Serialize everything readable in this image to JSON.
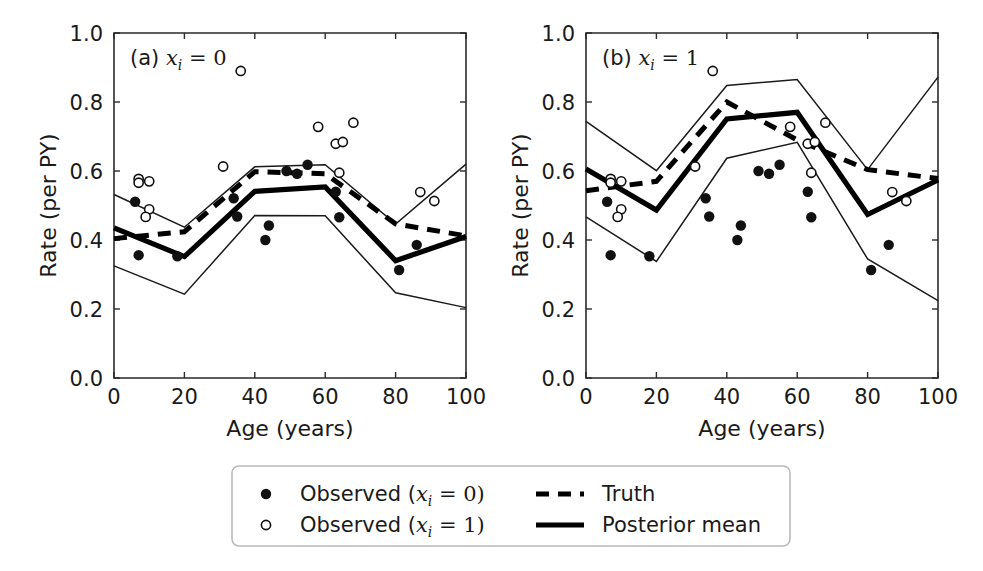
{
  "figure": {
    "width": 983,
    "height": 571,
    "background": "#ffffff",
    "ink_color": "#1a1a1a"
  },
  "chart_data": {
    "type": "line",
    "title": "",
    "panels": [
      {
        "id": "panel-a",
        "label_prefix": "(a)",
        "label_var": "x",
        "label_sub": "i",
        "label_eq": "= 0",
        "label_full": "(a) x_i = 0",
        "xlabel": "Age (years)",
        "ylabel": "Rate (per PY)",
        "xlim": [
          0,
          100
        ],
        "ylim": [
          0.0,
          1.0
        ],
        "xticks": [
          0,
          20,
          40,
          60,
          80,
          100
        ],
        "xticklabels": [
          "0",
          "20",
          "40",
          "60",
          "80",
          "100"
        ],
        "yticks": [
          0.0,
          0.2,
          0.4,
          0.6,
          0.8,
          1.0
        ],
        "yticklabels": [
          "0.0",
          "0.2",
          "0.4",
          "0.6",
          "0.8",
          "1.0"
        ],
        "grid": false,
        "series": [
          {
            "name": "Posterior mean",
            "style": "solid-thick",
            "x": [
              0,
              20,
              40,
              60,
              80,
              100
            ],
            "values": [
              0.435,
              0.352,
              0.541,
              0.554,
              0.34,
              0.41
            ]
          },
          {
            "name": "Truth",
            "style": "dashed-thick",
            "x": [
              0,
              20,
              40,
              60,
              80,
              100
            ],
            "values": [
              0.404,
              0.424,
              0.598,
              0.592,
              0.447,
              0.412
            ]
          },
          {
            "name": "Credible upper",
            "style": "solid-thin",
            "x": [
              0,
              20,
              40,
              60,
              80,
              100
            ],
            "values": [
              0.532,
              0.437,
              0.612,
              0.618,
              0.446,
              0.62
            ]
          },
          {
            "name": "Credible lower",
            "style": "solid-thin",
            "x": [
              0,
              20,
              40,
              60,
              80,
              100
            ],
            "values": [
              0.325,
              0.243,
              0.471,
              0.47,
              0.247,
              0.204
            ]
          }
        ],
        "points_filled": [
          {
            "x": 6,
            "y": 0.511
          },
          {
            "x": 7,
            "y": 0.356
          },
          {
            "x": 18,
            "y": 0.353
          },
          {
            "x": 34,
            "y": 0.521
          },
          {
            "x": 35,
            "y": 0.468
          },
          {
            "x": 43,
            "y": 0.4
          },
          {
            "x": 44,
            "y": 0.442
          },
          {
            "x": 49,
            "y": 0.6
          },
          {
            "x": 52,
            "y": 0.592
          },
          {
            "x": 55,
            "y": 0.618
          },
          {
            "x": 63,
            "y": 0.54
          },
          {
            "x": 64,
            "y": 0.466
          },
          {
            "x": 81,
            "y": 0.313
          },
          {
            "x": 86,
            "y": 0.386
          }
        ],
        "points_open": [
          {
            "x": 7,
            "y": 0.577
          },
          {
            "x": 7,
            "y": 0.566
          },
          {
            "x": 10,
            "y": 0.57
          },
          {
            "x": 10,
            "y": 0.489
          },
          {
            "x": 9,
            "y": 0.467
          },
          {
            "x": 31,
            "y": 0.613
          },
          {
            "x": 36,
            "y": 0.89
          },
          {
            "x": 58,
            "y": 0.728
          },
          {
            "x": 63,
            "y": 0.679
          },
          {
            "x": 65,
            "y": 0.684
          },
          {
            "x": 64,
            "y": 0.595
          },
          {
            "x": 68,
            "y": 0.74
          },
          {
            "x": 87,
            "y": 0.539
          },
          {
            "x": 91,
            "y": 0.513
          }
        ]
      },
      {
        "id": "panel-b",
        "label_prefix": "(b)",
        "label_var": "x",
        "label_sub": "i",
        "label_eq": "= 1",
        "label_full": "(b) x_i = 1",
        "xlabel": "Age (years)",
        "ylabel": "Rate (per PY)",
        "xlim": [
          0,
          100
        ],
        "ylim": [
          0.0,
          1.0
        ],
        "xticks": [
          0,
          20,
          40,
          60,
          80,
          100
        ],
        "xticklabels": [
          "0",
          "20",
          "40",
          "60",
          "80",
          "100"
        ],
        "yticks": [
          0.0,
          0.2,
          0.4,
          0.6,
          0.8,
          1.0
        ],
        "yticklabels": [
          "0.0",
          "0.2",
          "0.4",
          "0.6",
          "0.8",
          "1.0"
        ],
        "grid": false,
        "series": [
          {
            "name": "Posterior mean",
            "style": "solid-thick",
            "x": [
              0,
              20,
              40,
              60,
              80,
              100
            ],
            "values": [
              0.606,
              0.487,
              0.751,
              0.77,
              0.474,
              0.574
            ]
          },
          {
            "name": "Truth",
            "style": "dashed-thick",
            "x": [
              0,
              20,
              40,
              60,
              80,
              100
            ],
            "values": [
              0.543,
              0.57,
              0.8,
              0.69,
              0.604,
              0.578
            ]
          },
          {
            "name": "Credible upper",
            "style": "solid-thin",
            "x": [
              0,
              20,
              40,
              60,
              80,
              100
            ],
            "values": [
              0.744,
              0.601,
              0.848,
              0.865,
              0.604,
              0.872
            ]
          },
          {
            "name": "Credible lower",
            "style": "solid-thin",
            "x": [
              0,
              20,
              40,
              60,
              80,
              100
            ],
            "values": [
              0.467,
              0.338,
              0.637,
              0.683,
              0.345,
              0.224
            ]
          }
        ],
        "points_filled": [
          {
            "x": 6,
            "y": 0.511
          },
          {
            "x": 7,
            "y": 0.356
          },
          {
            "x": 18,
            "y": 0.353
          },
          {
            "x": 34,
            "y": 0.521
          },
          {
            "x": 35,
            "y": 0.468
          },
          {
            "x": 43,
            "y": 0.4
          },
          {
            "x": 44,
            "y": 0.442
          },
          {
            "x": 49,
            "y": 0.6
          },
          {
            "x": 52,
            "y": 0.592
          },
          {
            "x": 55,
            "y": 0.618
          },
          {
            "x": 63,
            "y": 0.54
          },
          {
            "x": 64,
            "y": 0.466
          },
          {
            "x": 81,
            "y": 0.313
          },
          {
            "x": 86,
            "y": 0.386
          }
        ],
        "points_open": [
          {
            "x": 7,
            "y": 0.577
          },
          {
            "x": 7,
            "y": 0.566
          },
          {
            "x": 10,
            "y": 0.57
          },
          {
            "x": 10,
            "y": 0.489
          },
          {
            "x": 9,
            "y": 0.467
          },
          {
            "x": 31,
            "y": 0.613
          },
          {
            "x": 36,
            "y": 0.89
          },
          {
            "x": 58,
            "y": 0.728
          },
          {
            "x": 63,
            "y": 0.679
          },
          {
            "x": 65,
            "y": 0.684
          },
          {
            "x": 64,
            "y": 0.595
          },
          {
            "x": 68,
            "y": 0.74
          },
          {
            "x": 87,
            "y": 0.539
          },
          {
            "x": 91,
            "y": 0.513
          }
        ]
      }
    ],
    "legend": {
      "position": "below-center",
      "entries": [
        {
          "marker": "filled-circle",
          "label_text": "Observed (",
          "label_var": "x",
          "label_sub": "i",
          "label_tail": "= 0)",
          "label_full": "Observed (x_i = 0)"
        },
        {
          "marker": "open-circle",
          "label_text": "Observed (",
          "label_var": "x",
          "label_sub": "i",
          "label_tail": "= 1)",
          "label_full": "Observed (x_i = 1)"
        },
        {
          "marker": "dashed-line",
          "label_text": "Truth",
          "label_full": "Truth"
        },
        {
          "marker": "solid-line",
          "label_text": "Posterior mean",
          "label_full": "Posterior mean"
        }
      ]
    }
  }
}
